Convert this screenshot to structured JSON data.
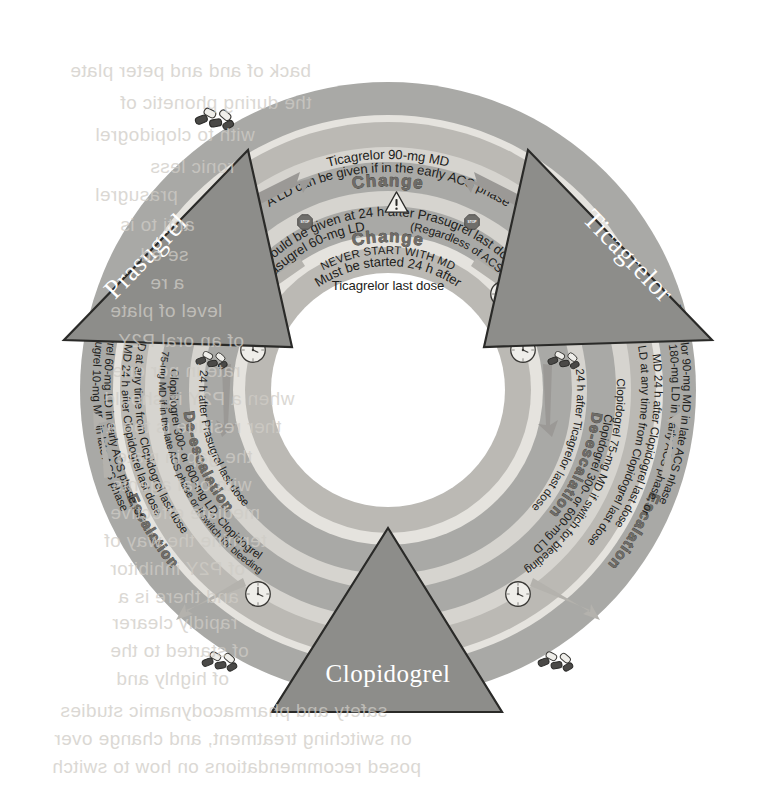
{
  "figure": {
    "type": "radial-wheel-diagram",
    "background_color": "#ffffff",
    "ring_colors": {
      "band_dark": "#a9a9a6",
      "band_light": "#d6d4cf",
      "band_mid": "#bbb9b4",
      "band_pale": "#e5e3de",
      "triangle": "#8d8d8a",
      "hub": "#ffffff",
      "text": "#1d1d1b",
      "band_label": "#6e6c68"
    }
  },
  "drugs": [
    {
      "id": "prasugrel",
      "label": "Prasugrel",
      "position": "upper-left"
    },
    {
      "id": "ticagrelor",
      "label": "Ticagrelor",
      "position": "upper-right"
    },
    {
      "id": "clopidogrel",
      "label": "Clopidogrel",
      "position": "bottom"
    }
  ],
  "transitions": [
    {
      "id": "prasugrel-to-ticagrelor",
      "band_label": "Change",
      "direction": "clockwise",
      "from": "Prasugrel",
      "to": "Ticagrelor",
      "outer_line_1": "Ticagrelor 90-mg MD",
      "outer_line_2": "A LD can be given if in the early ACS phase",
      "inner_line": "Should be given at 24 h after Prasugrel last dose",
      "icons": [
        "pills-icon",
        "clock-icon",
        "arrow-right-icon"
      ]
    },
    {
      "id": "ticagrelor-to-prasugrel",
      "band_label": "Change",
      "direction": "counter-clockwise",
      "from": "Ticagrelor",
      "to": "Prasugrel",
      "outer_line_1": "Prasugrel 60-mg LD",
      "outer_note": "(Regardless of ACS phase)",
      "outer_line_2": "NEVER START WITH MD",
      "inner_line_1": "Must be started 24 h after",
      "inner_line_2": "Ticagrelor last dose",
      "icons": [
        "pills-icon",
        "clock-icon",
        "warning-triangle-icon",
        "stop-sign-icon",
        "arrow-left-icon"
      ]
    },
    {
      "id": "prasugrel-to-clopidogrel",
      "band_label": "De-escalation",
      "direction": "down-left",
      "from": "Prasugrel",
      "to": "Clopidogrel",
      "inner_line": "24 h after Prasugrel last dose",
      "outer_line_1": "Clopidogrel 300- or 600-mg LD, Clopidogrel",
      "outer_line_2": "75-mg MD if in the late ACS phase or if switch for bleeding",
      "icons": [
        "pills-icon",
        "clock-icon",
        "arrow-down-icon"
      ]
    },
    {
      "id": "clopidogrel-to-prasugrel",
      "band_label": "Escalation",
      "direction": "up-left",
      "from": "Clopidogrel",
      "to": "Prasugrel",
      "inner_line_1": "LD at any time from Clopidogrel last dose",
      "inner_line_2": "MD 24 h after Clopidogrel last dose",
      "outer_line_1": "Prasugrel 60-mg LD in early ACS phase, or",
      "outer_line_2": "Prasugrel 10-mg MD in late ACS phase",
      "icons": [
        "pills-icon",
        "clock-icon",
        "arrow-up-icon"
      ]
    },
    {
      "id": "ticagrelor-to-clopidogrel",
      "band_label": "De-escalation",
      "direction": "down-right",
      "from": "Ticagrelor",
      "to": "Clopidogrel",
      "inner_line": "24 h after Ticagrelor last dose",
      "outer_line_1": "Clopidogrel 300- or 600-mg LD",
      "outer_line_2": "Clopidogrel 75-mg MD if switch for bleeding",
      "icons": [
        "pills-icon",
        "clock-icon",
        "arrow-down-icon"
      ]
    },
    {
      "id": "clopidogrel-to-ticagrelor",
      "band_label": "Escalation",
      "direction": "up-right",
      "from": "Clopidogrel",
      "to": "Ticagrelor",
      "inner_line_1": "LD at any time from Clopidogrel last dose",
      "inner_line_2": "MD 24 h after Clopidogrel last dose",
      "outer_line_1": "Ticagrelor 180-mg LD in early ACS phase, or",
      "outer_line_2": "Ticagrelor 90-mg MD in late ACS phase",
      "icons": [
        "pills-icon",
        "clock-icon",
        "arrow-up-icon"
      ]
    }
  ],
  "abbreviations": {
    "LD": "loading dose",
    "MD": "maintenance dose",
    "ACS": "acute coronary syndrome"
  },
  "ghost_text": [
    {
      "text": "back    of    and and peter plate",
      "x": 70,
      "y": 60
    },
    {
      "text": "the during    phonetic of",
      "x": 120,
      "y": 92
    },
    {
      "text": "with to    clopidogrel",
      "x": 95,
      "y": 124
    },
    {
      "text": "ronic    less",
      "x": 150,
      "y": 156
    },
    {
      "text": "prasugrel",
      "x": 95,
      "y": 184
    },
    {
      "text": "anti to is",
      "x": 120,
      "y": 214
    },
    {
      "text": "se ed",
      "x": 140,
      "y": 244
    },
    {
      "text": "a re",
      "x": 150,
      "y": 272
    },
    {
      "text": "level of plate",
      "x": 110,
      "y": 300
    },
    {
      "text": "of an oral P2Y",
      "x": 118,
      "y": 330
    },
    {
      "text": "rate in nor one",
      "x": 112,
      "y": 360
    },
    {
      "text": "when a P2Y is should",
      "x": 104,
      "y": 388
    },
    {
      "text": "ther residue is too a",
      "x": 106,
      "y": 416
    },
    {
      "text": "the gap in plate",
      "x": 116,
      "y": 446
    },
    {
      "text": "with oral agents",
      "x": 112,
      "y": 474
    },
    {
      "text": "mediate effective",
      "x": 110,
      "y": 502
    },
    {
      "text": "termine the way of",
      "x": 104,
      "y": 530
    },
    {
      "text": "of P2Y inhibitor",
      "x": 110,
      "y": 558
    },
    {
      "text": "and there is a",
      "x": 118,
      "y": 586
    },
    {
      "text": "rapidly clearer",
      "x": 112,
      "y": 612
    },
    {
      "text": "of started to the",
      "x": 110,
      "y": 640
    },
    {
      "text": "of highly and",
      "x": 116,
      "y": 668
    },
    {
      "text": "safety and pharmacodynamic studies",
      "x": 60,
      "y": 700
    },
    {
      "text": "on switching treatment, and change over",
      "x": 54,
      "y": 728
    },
    {
      "text": "posed recommendations on how to switch",
      "x": 52,
      "y": 756
    }
  ]
}
